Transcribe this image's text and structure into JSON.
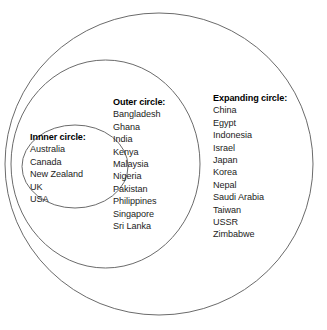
{
  "diagram": {
    "background_color": "#ffffff",
    "stroke_color": "#6b6b6b",
    "text_color": "#1c1c1c",
    "heading_color": "#000000"
  },
  "circles": [
    {
      "id": "expanding",
      "name": "expanding-circle",
      "cx": 159,
      "cy": 164,
      "rx": 154,
      "ry": 151
    },
    {
      "id": "outer",
      "name": "outer-circle",
      "cx": 105.5,
      "cy": 164,
      "rx": 94.5,
      "ry": 104
    },
    {
      "id": "inner",
      "name": "inner-circle",
      "cx": 75,
      "cy": 166.5,
      "rx": 53,
      "ry": 41.5
    }
  ],
  "groups": {
    "inner": {
      "heading": "Innner circle:",
      "countries": [
        "Australia",
        "Canada",
        "New Zealand",
        "UK",
        "USA"
      ]
    },
    "outer": {
      "heading": "Outer circle:",
      "countries": [
        "Bangladesh",
        "Ghana",
        "India",
        "Kenya",
        "Malaysia",
        "Nigeria",
        "Pakistan",
        "Philippines",
        "Singapore",
        "Sri Lanka"
      ]
    },
    "expanding": {
      "heading": "Expanding circle:",
      "countries": [
        "China",
        "Egypt",
        "Indonesia",
        "Israel",
        "Japan",
        "Korea",
        "Nepal",
        "Saudi Arabia",
        "Taiwan",
        "USSR",
        "Zimbabwe"
      ]
    }
  }
}
